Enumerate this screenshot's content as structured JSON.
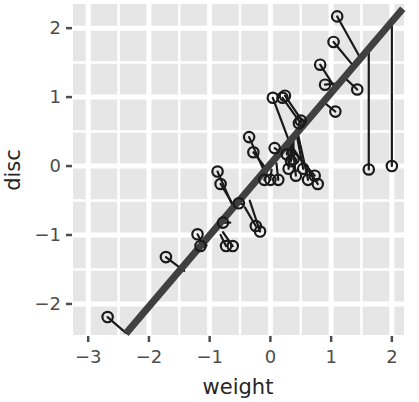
{
  "chart_data": {
    "type": "scatter",
    "title": "",
    "subtitle": "",
    "xlabel": "weight",
    "ylabel": "disc",
    "xlim": [
      -3.25,
      2.2
    ],
    "ylim": [
      -2.45,
      2.35
    ],
    "xticks": [
      -3,
      -2,
      -1,
      0,
      1,
      2
    ],
    "xtick_labels": [
      "−3",
      "−2",
      "−1",
      "0",
      "1",
      "2"
    ],
    "yticks": [
      -2,
      -1,
      0,
      1,
      2
    ],
    "ytick_labels": [
      "−2",
      "−1",
      "0",
      "1",
      "2"
    ],
    "grid": true,
    "grid_color": "#ffffff",
    "panel_color": "#e6e6e6",
    "point_color": "#1a1a1a",
    "point_fill": "none",
    "point_shape": "open-circle",
    "line_color": "#404040",
    "line_width": 7,
    "legend": "none",
    "annotations": [
      {
        "kind": "fit-line",
        "description": "Least-squares regression line of disc on weight",
        "x_start": -2.38,
        "y_start": -2.43,
        "x_end": 2.18,
        "y_end": 2.28
      },
      {
        "kind": "residual-segments",
        "description": "Thin segments connect each observation to its fitted value on the regression line"
      }
    ],
    "series": [
      {
        "name": "observations",
        "x": [
          -2.68,
          -1.72,
          -1.2,
          -1.15,
          -0.87,
          -0.82,
          -0.78,
          -0.73,
          -0.62,
          -0.52,
          -0.35,
          -0.28,
          -0.24,
          -0.17,
          -0.1,
          0.0,
          0.04,
          0.07,
          0.13,
          0.2,
          0.24,
          0.27,
          0.3,
          0.34,
          0.38,
          0.42,
          0.47,
          0.5,
          0.54,
          0.62,
          0.73,
          0.78,
          0.82,
          0.9,
          1.04,
          1.07,
          1.1,
          1.43,
          1.62,
          2.0
        ],
        "y": [
          -2.19,
          -1.32,
          -0.99,
          -1.16,
          -0.08,
          -0.26,
          -0.82,
          -1.16,
          -1.16,
          -0.54,
          0.42,
          0.2,
          -0.87,
          -0.95,
          -0.2,
          -0.2,
          0.99,
          0.26,
          -0.2,
          0.99,
          1.02,
          0.17,
          -0.04,
          0.07,
          0.1,
          -0.14,
          0.62,
          0.66,
          -0.04,
          -0.2,
          -0.14,
          -0.26,
          1.47,
          1.18,
          1.8,
          0.79,
          2.17,
          1.11,
          -0.05,
          0.0
        ],
        "n": 40
      }
    ],
    "residual_pairs": [
      {
        "x": -2.68,
        "y": -2.19,
        "fit_x": -2.38,
        "fit_y": -2.42
      },
      {
        "x": -1.72,
        "y": -1.32,
        "fit_x": -1.42,
        "fit_y": -1.52
      },
      {
        "x": -1.2,
        "y": -0.99,
        "fit_x": -1.08,
        "fit_y": -1.18
      },
      {
        "x": -1.15,
        "y": -1.16,
        "fit_x": -1.05,
        "fit_y": -1.15
      },
      {
        "x": -0.87,
        "y": -0.08,
        "fit_x": -0.62,
        "fit_y": -0.58
      },
      {
        "x": -0.82,
        "y": -0.26,
        "fit_x": -0.6,
        "fit_y": -0.58
      },
      {
        "x": -0.78,
        "y": -0.82,
        "fit_x": -0.66,
        "fit_y": -0.82
      },
      {
        "x": -0.73,
        "y": -1.16,
        "fit_x": -0.82,
        "fit_y": -1.0
      },
      {
        "x": -0.62,
        "y": -1.16,
        "fit_x": -0.78,
        "fit_y": -0.96
      },
      {
        "x": -0.52,
        "y": -0.54,
        "fit_x": -0.44,
        "fit_y": -0.56
      },
      {
        "x": -0.35,
        "y": 0.42,
        "fit_x": -0.1,
        "fit_y": -0.08
      },
      {
        "x": -0.28,
        "y": 0.2,
        "fit_x": -0.06,
        "fit_y": -0.05
      },
      {
        "x": -0.24,
        "y": -0.87,
        "fit_x": -0.42,
        "fit_y": -0.6
      },
      {
        "x": -0.17,
        "y": -0.95,
        "fit_x": -0.34,
        "fit_y": -0.5
      },
      {
        "x": -0.1,
        "y": -0.2,
        "fit_x": -0.06,
        "fit_y": -0.1
      },
      {
        "x": 0.0,
        "y": -0.2,
        "fit_x": 0.02,
        "fit_y": -0.05
      },
      {
        "x": 0.04,
        "y": 0.99,
        "fit_x": 0.3,
        "fit_y": 0.38
      },
      {
        "x": 0.07,
        "y": 0.26,
        "fit_x": 0.2,
        "fit_y": 0.18
      },
      {
        "x": 0.13,
        "y": -0.2,
        "fit_x": 0.1,
        "fit_y": 0.04
      },
      {
        "x": 0.2,
        "y": 0.99,
        "fit_x": 0.5,
        "fit_y": 0.62
      },
      {
        "x": 0.24,
        "y": 1.02,
        "fit_x": 0.52,
        "fit_y": 0.66
      },
      {
        "x": 0.27,
        "y": 0.17,
        "fit_x": 0.3,
        "fit_y": 0.3
      },
      {
        "x": 0.3,
        "y": -0.04,
        "fit_x": 0.3,
        "fit_y": 0.3
      },
      {
        "x": 0.34,
        "y": 0.07,
        "fit_x": 0.34,
        "fit_y": 0.34
      },
      {
        "x": 0.38,
        "y": 0.1,
        "fit_x": 0.38,
        "fit_y": 0.36
      },
      {
        "x": 0.42,
        "y": -0.14,
        "fit_x": 0.36,
        "fit_y": 0.33
      },
      {
        "x": 0.47,
        "y": 0.62,
        "fit_x": 0.5,
        "fit_y": 0.6
      },
      {
        "x": 0.5,
        "y": 0.66,
        "fit_x": 0.52,
        "fit_y": 0.62
      },
      {
        "x": 0.54,
        "y": -0.04,
        "fit_x": 0.44,
        "fit_y": 0.42
      },
      {
        "x": 0.62,
        "y": -0.2,
        "fit_x": 0.46,
        "fit_y": 0.44
      },
      {
        "x": 0.73,
        "y": -0.14,
        "fit_x": 0.3,
        "fit_y": 0.3
      },
      {
        "x": 0.78,
        "y": -0.26,
        "fit_x": 0.34,
        "fit_y": 0.3
      },
      {
        "x": 0.82,
        "y": 1.47,
        "fit_x": 1.06,
        "fit_y": 1.14
      },
      {
        "x": 0.9,
        "y": 1.18,
        "fit_x": 1.12,
        "fit_y": 1.2
      },
      {
        "x": 1.04,
        "y": 1.8,
        "fit_x": 1.36,
        "fit_y": 1.46
      },
      {
        "x": 1.07,
        "y": 0.79,
        "fit_x": 0.86,
        "fit_y": 0.94
      },
      {
        "x": 1.1,
        "y": 2.17,
        "fit_x": 1.46,
        "fit_y": 1.6
      },
      {
        "x": 1.43,
        "y": 1.11,
        "fit_x": 1.2,
        "fit_y": 1.3
      },
      {
        "x": 1.62,
        "y": -0.05,
        "fit_x": 1.62,
        "fit_y": 1.7
      },
      {
        "x": 2.0,
        "y": 0.0,
        "fit_x": 2.0,
        "fit_y": 2.1
      }
    ]
  }
}
